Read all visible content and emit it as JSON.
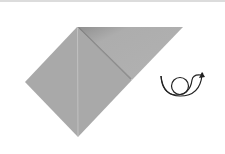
{
  "diagram": {
    "type": "origami-step",
    "colors": {
      "paper": "#a9a9a9",
      "paper_light": "#b4b4b4",
      "paper_shadow": "#8c8c8c",
      "crease": "#bdbdbd",
      "symbol": "#222222",
      "background": "#ffffff"
    },
    "symbol": "turn-over-icon"
  }
}
